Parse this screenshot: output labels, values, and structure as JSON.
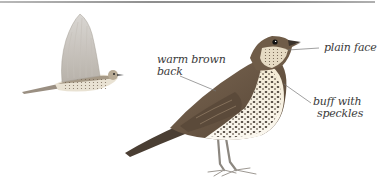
{
  "illustration": {
    "subject": "song thrush",
    "figures": [
      {
        "id": "flying-bird",
        "pose": "in flight"
      },
      {
        "id": "perched-bird",
        "pose": "standing"
      }
    ]
  },
  "annotations": {
    "back": {
      "line1": "warm brown",
      "line2": "back"
    },
    "face": {
      "line1": "plain face"
    },
    "breast": {
      "line1": "buff with",
      "line2": "speckles"
    }
  },
  "colors": {
    "back_brown": "#6e5a45",
    "breast_buff": "#efe3c8",
    "speckle": "#2a2018",
    "leader_line": "#777777",
    "label_text": "#3a3a3a",
    "top_rule": "#8f8f8f"
  }
}
